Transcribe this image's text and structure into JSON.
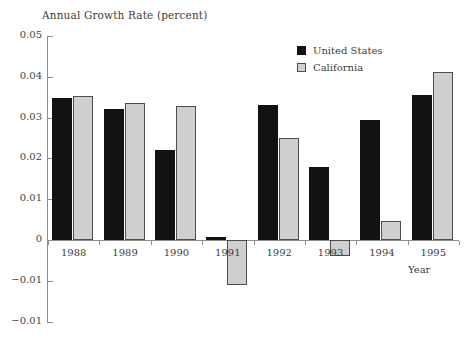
{
  "chart_data": {
    "type": "bar",
    "title": "Annual Growth Rate (percent)",
    "xlabel": "Year",
    "ylabel": "",
    "categories": [
      "1988",
      "1989",
      "1990",
      "1991",
      "1992",
      "1993",
      "1994",
      "1995"
    ],
    "series": [
      {
        "name": "United States",
        "color": "#111111",
        "values": [
          0.0348,
          0.032,
          0.022,
          0.0008,
          0.033,
          0.018,
          0.0295,
          0.0356
        ]
      },
      {
        "name": "California",
        "color": "#cfcfcf",
        "values": [
          0.0353,
          0.0337,
          0.0328,
          -0.011,
          0.0251,
          -0.004,
          0.0047,
          0.0412
        ]
      }
    ],
    "ylim": [
      -0.02,
      0.05
    ],
    "ytick_values": [
      0.05,
      0.04,
      0.03,
      0.02,
      0.01,
      0,
      -0.01,
      -0.02
    ],
    "ytick_labels": [
      "0.05",
      "0.04",
      "0.03",
      "0.02",
      "0.01",
      "0",
      "−0.01",
      "−0.01"
    ],
    "grid": false,
    "legend_position": "top-right"
  },
  "legend": {
    "entries": [
      {
        "label": "United States",
        "swatch": "black-square-swatch"
      },
      {
        "label": "California",
        "swatch": "gray-square-swatch"
      }
    ]
  }
}
